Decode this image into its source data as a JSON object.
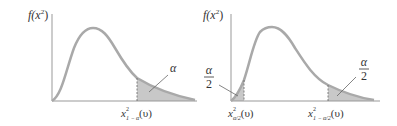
{
  "colors": {
    "curve": "#a9a9a9",
    "axis": "#999999",
    "shade": "#c8c8c8",
    "text": "#333333"
  },
  "left_figure": {
    "y_axis_label": {
      "f": "f(x",
      "sup": "2",
      "close": ")"
    },
    "area_label": "α",
    "critical_value": {
      "base": "x",
      "sup": "2",
      "sub": "1 − α",
      "arg": "(υ)"
    }
  },
  "right_figure": {
    "y_axis_label": {
      "f": "f(x",
      "sup": "2",
      "close": ")"
    },
    "left_area_label": {
      "num": "α",
      "den": "2"
    },
    "right_area_label": {
      "num": "α",
      "den": "2"
    },
    "lower_critical_value": {
      "base": "x",
      "sup": "2",
      "sub": "α/2",
      "arg": "(υ)"
    },
    "upper_critical_value": {
      "base": "x",
      "sup": "2",
      "sub": "1 − α/2",
      "arg": "(υ)"
    }
  }
}
